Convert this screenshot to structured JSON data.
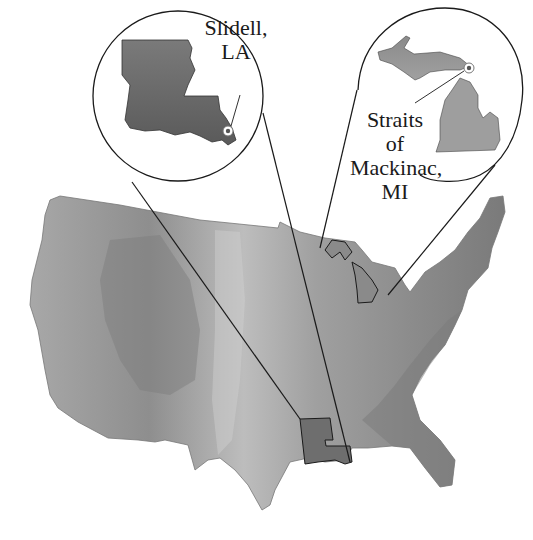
{
  "figure": {
    "type": "map",
    "region": "Contiguous United States (shaded relief)",
    "insets": [
      {
        "id": "louisiana",
        "state": "Louisiana",
        "label_line1": "Slidell,",
        "label_line2": "LA",
        "marker": "Slidell"
      },
      {
        "id": "michigan",
        "state": "Michigan",
        "label_line1": "Straits",
        "label_line2": "of",
        "label_line3": "Mackinac,",
        "label_line4": "MI",
        "marker": "Straits of Mackinac"
      }
    ],
    "colors": {
      "background": "#ffffff",
      "relief_dark": "#6e6e6e",
      "relief_mid": "#9a9a9a",
      "relief_light": "#c8c8c8",
      "outline": "#1a1a1a",
      "marker_ring": "#ffffff",
      "marker_dot": "#555555"
    }
  }
}
